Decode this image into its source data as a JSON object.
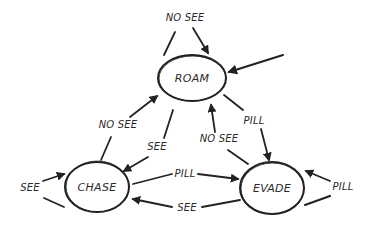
{
  "diagram": {
    "type": "state-machine",
    "style": "hand-drawn",
    "colors": {
      "ink": "#222222",
      "background": "#ffffff"
    },
    "nodes": [
      {
        "id": "roam",
        "label": "ROAM",
        "cx": 192,
        "cy": 78,
        "rx": 34,
        "ry": 23
      },
      {
        "id": "chase",
        "label": "CHASE",
        "cx": 97,
        "cy": 187,
        "rx": 32,
        "ry": 25
      },
      {
        "id": "evade",
        "label": "EVADE",
        "cx": 272,
        "cy": 188,
        "rx": 32,
        "ry": 26
      }
    ],
    "edges": [
      {
        "id": "roam-self",
        "from": "roam",
        "to": "roam",
        "label": "NO SEE"
      },
      {
        "id": "entry-roam",
        "from": null,
        "to": "roam",
        "label": ""
      },
      {
        "id": "chase-roam",
        "from": "chase",
        "to": "roam",
        "label": "NO SEE"
      },
      {
        "id": "roam-chase",
        "from": "roam",
        "to": "chase",
        "label": "SEE"
      },
      {
        "id": "roam-evade",
        "from": "roam",
        "to": "evade",
        "label": "PILL"
      },
      {
        "id": "evade-roam",
        "from": "evade",
        "to": "roam",
        "label": "NO SEE"
      },
      {
        "id": "chase-evade",
        "from": "chase",
        "to": "evade",
        "label": "PILL"
      },
      {
        "id": "evade-chase",
        "from": "evade",
        "to": "chase",
        "label": "SEE"
      },
      {
        "id": "chase-self",
        "from": "chase",
        "to": "chase",
        "label": "SEE"
      },
      {
        "id": "evade-self",
        "from": "evade",
        "to": "evade",
        "label": "PILL"
      }
    ]
  }
}
